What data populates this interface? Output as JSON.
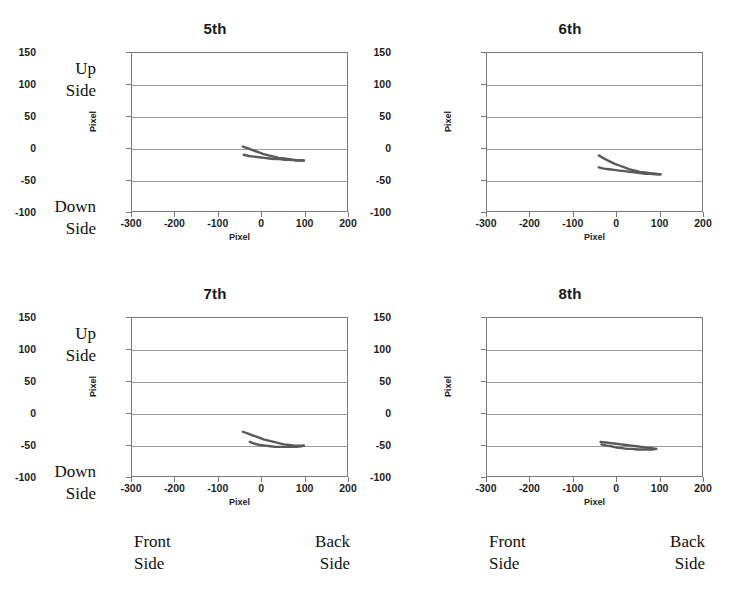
{
  "figure": {
    "axis_label_x": "Pixel",
    "axis_label_y": "Pixel",
    "annotations": {
      "up_side": "Up\nSide",
      "down_side": "Down\nSide",
      "front_side": "Front\nSide",
      "back_side": "Back\nSide"
    },
    "trace_color": "#595959",
    "grid_color": "#9a9a9a",
    "frame_color": "#7a7a7a"
  },
  "chart_data": [
    {
      "type": "scatter",
      "title": "5th",
      "xlabel": "Pixel",
      "ylabel": "Pixel",
      "xlim": [
        -300,
        200
      ],
      "ylim": [
        -100,
        150
      ],
      "xticks": [
        -300,
        -200,
        -100,
        0,
        100,
        200
      ],
      "yticks": [
        -100,
        -50,
        0,
        50,
        100,
        150
      ],
      "grid": true,
      "series": [
        {
          "name": "upper-branch",
          "x": [
            -42,
            -30,
            -18,
            -6,
            6,
            18,
            30,
            42,
            54,
            66,
            78,
            90,
            100
          ],
          "y": [
            2,
            -1,
            -4,
            -7,
            -10,
            -12,
            -14,
            -16,
            -17,
            -18,
            -19,
            -20,
            -20
          ]
        },
        {
          "name": "lower-branch",
          "x": [
            -40,
            -28,
            -16,
            -4,
            8,
            20,
            32,
            44,
            56,
            68,
            80,
            92,
            100
          ],
          "y": [
            -11,
            -13,
            -14,
            -15,
            -16,
            -17,
            -18,
            -18,
            -19,
            -19,
            -20,
            -20,
            -20
          ]
        }
      ]
    },
    {
      "type": "scatter",
      "title": "6th",
      "xlabel": "Pixel",
      "ylabel": "Pixel",
      "xlim": [
        -300,
        200
      ],
      "ylim": [
        -100,
        150
      ],
      "xticks": [
        -300,
        -200,
        -100,
        0,
        100,
        200
      ],
      "yticks": [
        -100,
        -50,
        0,
        50,
        100,
        150
      ],
      "grid": true,
      "series": [
        {
          "name": "upper-branch",
          "x": [
            -40,
            -28,
            -16,
            -4,
            8,
            20,
            32,
            44,
            56,
            68,
            80,
            92,
            104
          ],
          "y": [
            -12,
            -17,
            -21,
            -25,
            -28,
            -31,
            -34,
            -36,
            -38,
            -39,
            -40,
            -41,
            -42
          ]
        },
        {
          "name": "lower-branch",
          "x": [
            -40,
            -28,
            -16,
            -4,
            8,
            20,
            32,
            44,
            56,
            68,
            80,
            92,
            104
          ],
          "y": [
            -31,
            -33,
            -34,
            -35,
            -36,
            -37,
            -38,
            -39,
            -40,
            -41,
            -41,
            -42,
            -42
          ]
        }
      ]
    },
    {
      "type": "scatter",
      "title": "7th",
      "xlabel": "Pixel",
      "ylabel": "Pixel",
      "xlim": [
        -300,
        200
      ],
      "ylim": [
        -100,
        150
      ],
      "xticks": [
        -300,
        -200,
        -100,
        0,
        100,
        200
      ],
      "yticks": [
        -100,
        -50,
        0,
        50,
        100,
        150
      ],
      "grid": true,
      "series": [
        {
          "name": "upper-branch",
          "x": [
            -42,
            -30,
            -18,
            -6,
            6,
            18,
            30,
            42,
            54,
            66,
            78,
            90,
            100
          ],
          "y": [
            -30,
            -33,
            -36,
            -39,
            -42,
            -44,
            -46,
            -48,
            -50,
            -51,
            -52,
            -52,
            -52
          ]
        },
        {
          "name": "lower-branch",
          "x": [
            -26,
            -14,
            -2,
            10,
            22,
            34,
            46,
            58,
            70,
            82,
            94,
            100
          ],
          "y": [
            -46,
            -49,
            -51,
            -52,
            -53,
            -54,
            -54,
            -54,
            -54,
            -54,
            -53,
            -52
          ]
        }
      ]
    },
    {
      "type": "scatter",
      "title": "8th",
      "xlabel": "Pixel",
      "ylabel": "Pixel",
      "xlim": [
        -300,
        200
      ],
      "ylim": [
        -100,
        150
      ],
      "xticks": [
        -300,
        -200,
        -100,
        0,
        100,
        200
      ],
      "yticks": [
        -100,
        -50,
        0,
        50,
        100,
        150
      ],
      "grid": true,
      "series": [
        {
          "name": "upper-branch",
          "x": [
            -36,
            -24,
            -12,
            0,
            12,
            24,
            36,
            48,
            60,
            72,
            84,
            94
          ],
          "y": [
            -46,
            -47,
            -48,
            -49,
            -50,
            -51,
            -52,
            -53,
            -54,
            -55,
            -56,
            -57
          ]
        },
        {
          "name": "lower-branch",
          "x": [
            -34,
            -22,
            -10,
            2,
            14,
            26,
            38,
            50,
            62,
            74,
            86,
            94
          ],
          "y": [
            -50,
            -52,
            -53,
            -55,
            -56,
            -57,
            -57,
            -58,
            -58,
            -58,
            -58,
            -57
          ]
        }
      ]
    }
  ]
}
